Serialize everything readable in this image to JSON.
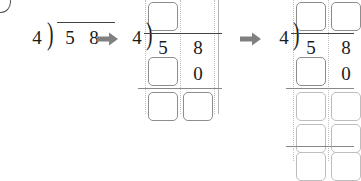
{
  "worksheet": {
    "type": "long-division-steps",
    "problem": {
      "dividend": "58",
      "divisor": "4",
      "operation": "division"
    },
    "corner_marker": "partial-circled-number",
    "arrow_glyph": "right-arrow",
    "colors": {
      "ink": "#1b1b1b",
      "rule": "#888888",
      "box_border": "#8d8d8d",
      "guide_dotted": "#c0c0c0",
      "arrow": "#808080",
      "page": "#ffffff"
    },
    "stages": [
      {
        "id": "stage-1",
        "label": "initial-setup",
        "divisor": "4",
        "dividend_digits": [
          "5",
          "8"
        ],
        "boxes": []
      },
      {
        "id": "stage-2",
        "label": "first-partial-quotient",
        "divisor": "4",
        "dividend_digits": [
          "5",
          "8"
        ],
        "quotient_boxes": [
          "",
          ""
        ],
        "subtract_row": {
          "box": "",
          "digit": "0"
        },
        "remainder_boxes": [
          "",
          ""
        ]
      },
      {
        "id": "stage-3",
        "label": "continued-division",
        "divisor": "4",
        "dividend_digits": [
          "5",
          "8"
        ],
        "quotient_boxes": [
          "",
          ""
        ],
        "subtract_row": {
          "box": "",
          "digit": "0"
        },
        "remainder_boxes_row1": [
          "",
          ""
        ],
        "remainder_boxes_row2": [
          "",
          ""
        ],
        "final_boxes": [
          "",
          ""
        ]
      }
    ]
  }
}
